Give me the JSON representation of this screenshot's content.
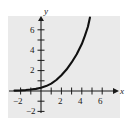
{
  "chart_data": {
    "type": "line",
    "title": "",
    "subtitle": "",
    "xlabel": "x",
    "ylabel": "y",
    "xlim": [
      -2.6,
      7.2
    ],
    "ylim": [
      -2.6,
      7.4
    ],
    "xticks": [
      -2,
      -1,
      1,
      2,
      3,
      4,
      5,
      6
    ],
    "yticks": [
      -2,
      -1,
      1,
      2,
      3,
      4,
      5,
      6
    ],
    "xtick_labels": [
      "-2",
      "2",
      "4",
      "6"
    ],
    "ytick_labels": [
      "6",
      "4",
      "2",
      "-2"
    ],
    "grid": false,
    "legend": null,
    "annotations": [],
    "series": [
      {
        "name": "exponential curve",
        "values": [
          {
            "x": -2.6,
            "y": 0.04
          },
          {
            "x": -2.0,
            "y": 0.06
          },
          {
            "x": -1.5,
            "y": 0.09
          },
          {
            "x": -1.0,
            "y": 0.14
          },
          {
            "x": -0.5,
            "y": 0.21
          },
          {
            "x": 0.0,
            "y": 0.32
          },
          {
            "x": 0.5,
            "y": 0.48
          },
          {
            "x": 1.0,
            "y": 0.72
          },
          {
            "x": 1.5,
            "y": 1.08
          },
          {
            "x": 2.0,
            "y": 1.55
          },
          {
            "x": 2.5,
            "y": 2.1
          },
          {
            "x": 3.0,
            "y": 2.8
          },
          {
            "x": 3.5,
            "y": 3.6
          },
          {
            "x": 4.0,
            "y": 4.6
          },
          {
            "x": 4.3,
            "y": 5.4
          },
          {
            "x": 4.6,
            "y": 6.3
          },
          {
            "x": 4.8,
            "y": 7.2
          }
        ]
      }
    ]
  },
  "axes": {
    "x_axis_name": "x",
    "y_axis_name": "y"
  },
  "labels": {
    "x_neg2": "−2",
    "x_2": "2",
    "x_4": "4",
    "x_6": "6",
    "y_6": "6",
    "y_4": "4",
    "y_2": "2",
    "y_neg2": "−2"
  },
  "colors": {
    "panel_background": "#eaeaea",
    "page_background": "#ffffff",
    "axis": "#1a1a1a",
    "curve": "#111111"
  }
}
